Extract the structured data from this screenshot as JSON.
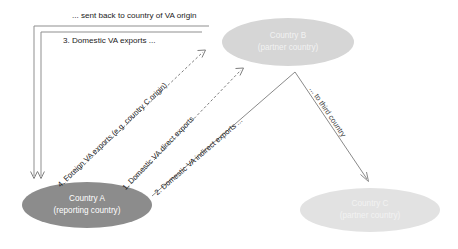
{
  "diagram": {
    "colors": {
      "node_reporting_fill": "#8c8c8c",
      "node_partner_fill": "#d6d6d6",
      "node_partner_c_fill": "#e2e2e2",
      "connector_solid": "#8a8a8a",
      "connector_dashed": "#6e6e6e",
      "label_text": "#1b1b1b",
      "node_text": "#ffffff",
      "background": "#ffffff"
    },
    "nodes": [
      {
        "id": "country-a",
        "name": "Country A",
        "subtitle": "(reporting country)",
        "role": "reporting country"
      },
      {
        "id": "country-b",
        "name": "Country B",
        "subtitle": "(partner country)",
        "role": "partner country"
      },
      {
        "id": "country-c",
        "name": "Country C",
        "subtitle": "(partner country)",
        "role": "partner country"
      }
    ],
    "flows": [
      {
        "id": "flow-1",
        "label": "1. Domestic VA direct exports",
        "from": "country-a",
        "to": "country-b",
        "style": "dashed"
      },
      {
        "id": "flow-2",
        "label": "2. Domestic VA indirect  exports ...",
        "from": "country-a",
        "to": "country-b",
        "style": "solid"
      },
      {
        "id": "flow-3",
        "label": "3. Domestic VA  exports ...",
        "from": "country-b",
        "to": "country-a",
        "style": "bracket"
      },
      {
        "id": "flow-4",
        "label": "4. Foreign VA exports (e.g.  country C origin)",
        "from": "country-a",
        "to": "country-b",
        "style": "dashed"
      }
    ],
    "annotations": [
      {
        "id": "annotation-sent-back",
        "text": "... sent back to country of VA origin"
      },
      {
        "id": "annotation-third-country",
        "text": "... to third country"
      }
    ]
  }
}
